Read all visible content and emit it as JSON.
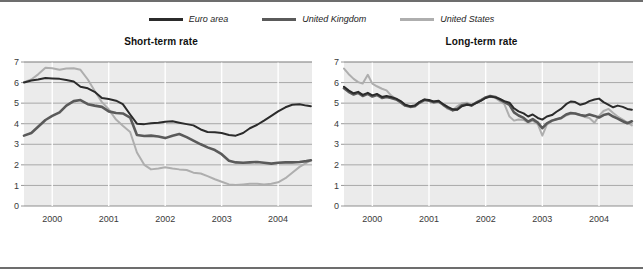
{
  "figure": {
    "legend": [
      {
        "label": "Euro area",
        "color": "#2b2b2b",
        "icon": "line-swatch-icon"
      },
      {
        "label": "United Kingdom",
        "color": "#5a5a5a",
        "icon": "line-swatch-icon"
      },
      {
        "label": "United States",
        "color": "#aeaeae",
        "icon": "line-swatch-icon"
      }
    ],
    "panels": [
      {
        "id": "short",
        "title": "Short-term rate"
      },
      {
        "id": "long",
        "title": "Long-term rate"
      }
    ]
  },
  "chart_data": [
    {
      "type": "line",
      "title": "Short-term rate",
      "xlabel": "",
      "ylabel": "",
      "xlim": [
        1999.5,
        2004.6
      ],
      "ylim": [
        0,
        7
      ],
      "yticks": [
        0,
        1,
        2,
        3,
        4,
        5,
        6,
        7
      ],
      "xticks": [
        2000,
        2001,
        2002,
        2003,
        2004
      ],
      "ytick_labels": [
        "0",
        "1",
        "2",
        "3",
        "4",
        "5",
        "6",
        "7"
      ],
      "xtick_labels": [
        "2000",
        "2001",
        "2002",
        "2003",
        "2004"
      ],
      "grid": "horizontal-gray-vertical-white",
      "legend_position": "top-center-shared",
      "series": [
        {
          "name": "Euro area",
          "color": "#2b2b2b",
          "x": [
            1999.5,
            1999.63,
            1999.75,
            1999.88,
            2000.0,
            2000.13,
            2000.25,
            2000.38,
            2000.5,
            2000.63,
            2000.75,
            2000.88,
            2001.0,
            2001.13,
            2001.25,
            2001.38,
            2001.5,
            2001.63,
            2001.75,
            2001.88,
            2002.0,
            2002.13,
            2002.25,
            2002.38,
            2002.5,
            2002.63,
            2002.75,
            2002.88,
            2003.0,
            2003.13,
            2003.25,
            2003.38,
            2003.5,
            2003.63,
            2003.75,
            2003.88,
            2004.0,
            2004.13,
            2004.25,
            2004.38,
            2004.5,
            2004.58
          ],
          "y": [
            6.0,
            6.1,
            6.15,
            6.22,
            6.2,
            6.18,
            6.12,
            6.05,
            5.8,
            5.72,
            5.55,
            5.25,
            5.2,
            5.12,
            4.95,
            4.45,
            4.0,
            3.98,
            4.02,
            4.05,
            4.1,
            4.12,
            4.05,
            3.98,
            3.92,
            3.72,
            3.6,
            3.58,
            3.55,
            3.45,
            3.42,
            3.55,
            3.78,
            3.95,
            4.15,
            4.38,
            4.6,
            4.8,
            4.92,
            4.95,
            4.88,
            4.85
          ]
        },
        {
          "name": "United Kingdom",
          "color": "#5a5a5a",
          "x": [
            1999.5,
            1999.63,
            1999.75,
            1999.88,
            2000.0,
            2000.13,
            2000.25,
            2000.38,
            2000.5,
            2000.63,
            2000.75,
            2000.88,
            2001.0,
            2001.13,
            2001.25,
            2001.38,
            2001.5,
            2001.63,
            2001.75,
            2001.88,
            2002.0,
            2002.13,
            2002.25,
            2002.38,
            2002.5,
            2002.63,
            2002.75,
            2002.88,
            2003.0,
            2003.13,
            2003.25,
            2003.38,
            2003.5,
            2003.63,
            2003.75,
            2003.88,
            2004.0,
            2004.13,
            2004.25,
            2004.38,
            2004.5,
            2004.58
          ],
          "y": [
            3.42,
            3.55,
            3.85,
            4.18,
            4.38,
            4.55,
            4.88,
            5.1,
            5.15,
            4.95,
            4.88,
            4.82,
            4.6,
            4.52,
            4.5,
            4.3,
            3.45,
            3.4,
            3.42,
            3.38,
            3.3,
            3.42,
            3.5,
            3.35,
            3.18,
            3.0,
            2.85,
            2.72,
            2.52,
            2.2,
            2.12,
            2.1,
            2.12,
            2.14,
            2.1,
            2.06,
            2.1,
            2.12,
            2.12,
            2.14,
            2.18,
            2.22
          ]
        },
        {
          "name": "United States",
          "color": "#aeaeae",
          "x": [
            1999.5,
            1999.63,
            1999.75,
            1999.88,
            2000.0,
            2000.13,
            2000.25,
            2000.38,
            2000.5,
            2000.63,
            2000.75,
            2000.88,
            2001.0,
            2001.13,
            2001.25,
            2001.38,
            2001.5,
            2001.63,
            2001.75,
            2001.88,
            2002.0,
            2002.13,
            2002.25,
            2002.38,
            2002.5,
            2002.63,
            2002.75,
            2002.88,
            2003.0,
            2003.13,
            2003.25,
            2003.38,
            2003.5,
            2003.63,
            2003.75,
            2003.88,
            2004.0,
            2004.13,
            2004.25,
            2004.38,
            2004.5,
            2004.58
          ],
          "y": [
            6.02,
            6.15,
            6.4,
            6.72,
            6.7,
            6.62,
            6.68,
            6.7,
            6.62,
            6.15,
            5.6,
            5.05,
            4.7,
            4.2,
            3.9,
            3.6,
            2.6,
            2.0,
            1.78,
            1.82,
            1.88,
            1.82,
            1.78,
            1.75,
            1.62,
            1.58,
            1.45,
            1.3,
            1.18,
            1.05,
            1.02,
            1.05,
            1.08,
            1.08,
            1.05,
            1.08,
            1.15,
            1.35,
            1.62,
            1.9,
            2.1,
            2.22
          ]
        }
      ]
    },
    {
      "type": "line",
      "title": "Long-term rate",
      "xlabel": "",
      "ylabel": "",
      "xlim": [
        1999.5,
        2004.6
      ],
      "ylim": [
        0,
        7
      ],
      "yticks": [
        0,
        1,
        2,
        3,
        4,
        5,
        6,
        7
      ],
      "xticks": [
        2000,
        2001,
        2002,
        2003,
        2004
      ],
      "ytick_labels": [
        "0",
        "1",
        "2",
        "3",
        "4",
        "5",
        "6",
        "7"
      ],
      "xtick_labels": [
        "2000",
        "2001",
        "2002",
        "2003",
        "2004"
      ],
      "grid": "horizontal-gray-vertical-white",
      "legend_position": "top-center-shared",
      "series": [
        {
          "name": "Euro area",
          "color": "#2b2b2b",
          "x": [
            1999.5,
            1999.58,
            1999.67,
            1999.75,
            1999.83,
            1999.92,
            2000.0,
            2000.08,
            2000.17,
            2000.25,
            2000.33,
            2000.42,
            2000.5,
            2000.58,
            2000.67,
            2000.75,
            2000.83,
            2000.92,
            2001.0,
            2001.08,
            2001.17,
            2001.25,
            2001.33,
            2001.42,
            2001.5,
            2001.58,
            2001.67,
            2001.75,
            2001.83,
            2001.92,
            2002.0,
            2002.08,
            2002.17,
            2002.25,
            2002.33,
            2002.42,
            2002.5,
            2002.58,
            2002.67,
            2002.75,
            2002.83,
            2002.92,
            2003.0,
            2003.08,
            2003.17,
            2003.25,
            2003.33,
            2003.42,
            2003.5,
            2003.58,
            2003.67,
            2003.75,
            2003.83,
            2003.92,
            2004.0,
            2004.08,
            2004.17,
            2004.25,
            2004.33,
            2004.42,
            2004.5,
            2004.58
          ],
          "y": [
            5.8,
            5.62,
            5.48,
            5.55,
            5.4,
            5.5,
            5.38,
            5.45,
            5.3,
            5.35,
            5.3,
            5.22,
            5.1,
            4.92,
            4.85,
            4.88,
            5.05,
            5.18,
            5.15,
            5.08,
            5.12,
            4.95,
            4.82,
            4.7,
            4.68,
            4.85,
            4.92,
            4.9,
            5.0,
            5.12,
            5.25,
            5.32,
            5.28,
            5.2,
            5.1,
            5.02,
            4.75,
            4.6,
            4.5,
            4.35,
            4.45,
            4.28,
            4.2,
            4.35,
            4.42,
            4.58,
            4.72,
            4.95,
            5.08,
            5.05,
            4.92,
            4.98,
            5.1,
            5.18,
            5.22,
            5.05,
            4.92,
            4.8,
            4.88,
            4.82,
            4.72,
            4.68
          ]
        },
        {
          "name": "United Kingdom",
          "color": "#5a5a5a",
          "x": [
            1999.5,
            1999.58,
            1999.67,
            1999.75,
            1999.83,
            1999.92,
            2000.0,
            2000.08,
            2000.17,
            2000.25,
            2000.33,
            2000.42,
            2000.5,
            2000.58,
            2000.67,
            2000.75,
            2000.83,
            2000.92,
            2001.0,
            2001.08,
            2001.17,
            2001.25,
            2001.33,
            2001.42,
            2001.5,
            2001.58,
            2001.67,
            2001.75,
            2001.83,
            2001.92,
            2002.0,
            2002.08,
            2002.17,
            2002.25,
            2002.33,
            2002.42,
            2002.5,
            2002.58,
            2002.67,
            2002.75,
            2002.83,
            2002.92,
            2003.0,
            2003.08,
            2003.17,
            2003.25,
            2003.33,
            2003.42,
            2003.5,
            2003.58,
            2003.67,
            2003.75,
            2003.83,
            2003.92,
            2004.0,
            2004.08,
            2004.17,
            2004.25,
            2004.33,
            2004.42,
            2004.5,
            2004.58
          ],
          "y": [
            5.72,
            5.55,
            5.42,
            5.5,
            5.35,
            5.45,
            5.32,
            5.4,
            5.25,
            5.3,
            5.25,
            5.18,
            5.05,
            4.88,
            4.82,
            4.85,
            5.02,
            5.15,
            5.12,
            5.05,
            5.08,
            4.92,
            4.78,
            4.65,
            4.72,
            4.9,
            4.95,
            4.88,
            5.02,
            5.15,
            5.28,
            5.35,
            5.3,
            5.18,
            5.05,
            4.92,
            4.55,
            4.4,
            4.28,
            4.1,
            4.22,
            4.05,
            3.78,
            4.02,
            4.15,
            4.22,
            4.28,
            4.45,
            4.52,
            4.5,
            4.42,
            4.38,
            4.45,
            4.38,
            4.3,
            4.42,
            4.48,
            4.35,
            4.25,
            4.12,
            4.02,
            4.12
          ]
        },
        {
          "name": "United States",
          "color": "#aeaeae",
          "x": [
            1999.5,
            1999.58,
            1999.67,
            1999.75,
            1999.83,
            1999.92,
            2000.0,
            2000.08,
            2000.17,
            2000.25,
            2000.33,
            2000.42,
            2000.5,
            2000.58,
            2000.67,
            2000.75,
            2000.83,
            2000.92,
            2001.0,
            2001.08,
            2001.17,
            2001.25,
            2001.33,
            2001.42,
            2001.5,
            2001.58,
            2001.67,
            2001.75,
            2001.83,
            2001.92,
            2002.0,
            2002.08,
            2002.17,
            2002.25,
            2002.33,
            2002.42,
            2002.5,
            2002.58,
            2002.67,
            2002.75,
            2002.83,
            2002.92,
            2003.0,
            2003.08,
            2003.17,
            2003.25,
            2003.33,
            2003.42,
            2003.5,
            2003.58,
            2003.67,
            2003.75,
            2003.83,
            2003.92,
            2004.0,
            2004.08,
            2004.17,
            2004.25,
            2004.33,
            2004.42,
            2004.5,
            2004.58
          ],
          "y": [
            6.68,
            6.42,
            6.18,
            6.02,
            5.95,
            6.38,
            5.95,
            5.82,
            5.7,
            5.62,
            5.38,
            5.2,
            5.02,
            4.88,
            4.85,
            4.88,
            5.05,
            5.18,
            5.12,
            5.02,
            5.1,
            4.92,
            4.72,
            4.65,
            4.85,
            5.0,
            5.02,
            4.92,
            5.02,
            5.15,
            5.28,
            5.32,
            5.25,
            5.1,
            4.95,
            4.35,
            4.15,
            4.2,
            4.18,
            4.05,
            4.15,
            3.98,
            3.42,
            3.95,
            4.15,
            4.22,
            4.25,
            4.4,
            4.48,
            4.5,
            4.42,
            4.32,
            4.28,
            4.05,
            4.38,
            4.62,
            4.72,
            4.52,
            4.35,
            4.2,
            4.05,
            3.92
          ]
        }
      ]
    }
  ]
}
